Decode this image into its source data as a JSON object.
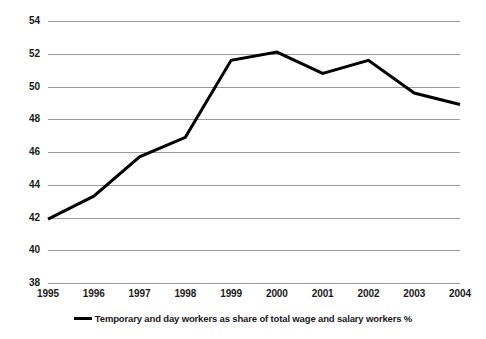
{
  "chart_data": {
    "type": "line",
    "title": "",
    "subtitle": "",
    "xlabel": "",
    "ylabel": "",
    "categories": [
      "1995",
      "1996",
      "1997",
      "1998",
      "1999",
      "2000",
      "2001",
      "2002",
      "2003",
      "2004"
    ],
    "series": [
      {
        "name": "Temporary and day workers as share of total wage and salary workers %",
        "values": [
          41.9,
          43.3,
          45.7,
          46.9,
          51.6,
          52.1,
          50.8,
          51.6,
          49.6,
          48.9
        ],
        "color": "#000000"
      }
    ],
    "ylim": [
      38,
      54
    ],
    "y_ticks": [
      38,
      40,
      42,
      44,
      46,
      48,
      50,
      52,
      54
    ],
    "y_tick_labels": [
      "38",
      "40",
      "42",
      "44",
      "46",
      "48",
      "50",
      "52",
      "54"
    ],
    "x_tick_labels": [
      "1995",
      "1996",
      "1997",
      "1998",
      "1999",
      "2000",
      "2001",
      "2002",
      "2003",
      "2004"
    ],
    "grid": {
      "horizontal": true,
      "vertical": false,
      "color": "#9a9a9a"
    },
    "legend": {
      "position": "bottom-center",
      "entries": [
        {
          "label": "Temporary and day workers as share of total wage and salary workers %",
          "marker": "line-swatch",
          "color": "#000000"
        }
      ]
    },
    "annotations": []
  }
}
